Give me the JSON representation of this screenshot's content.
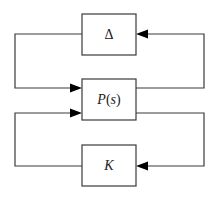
{
  "diagram": {
    "type": "block-diagram",
    "title": "",
    "blocks": [
      {
        "id": "delta",
        "label": "Δ"
      },
      {
        "id": "plant",
        "label": "P(s)",
        "label_main": "P",
        "label_open": "(",
        "label_arg": "s",
        "label_close": ")"
      },
      {
        "id": "controller",
        "label": "K"
      }
    ],
    "connections": [
      {
        "from": "delta",
        "to": "plant",
        "route": "left loop, upper"
      },
      {
        "from": "plant",
        "to": "delta",
        "route": "right loop, upper"
      },
      {
        "from": "controller",
        "to": "plant",
        "route": "left loop, lower"
      },
      {
        "from": "plant",
        "to": "controller",
        "route": "right loop, lower"
      }
    ],
    "colors": {
      "line": "#3a3a3a",
      "arrow": "#000000",
      "background": "#ffffff"
    }
  }
}
